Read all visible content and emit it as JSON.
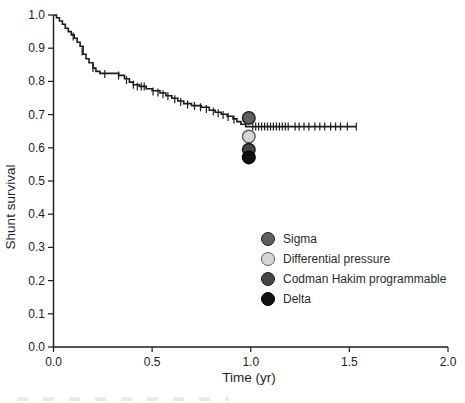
{
  "figure": {
    "background": "#ffffff",
    "text_color": "#1c1c1c"
  },
  "chart_data": {
    "type": "line",
    "chart_kind": "kaplan-meier-step-curve",
    "title": "",
    "xlabel": "Time (yr)",
    "ylabel": "Shunt survival",
    "xlim": [
      0.0,
      2.0
    ],
    "ylim": [
      0.0,
      1.0
    ],
    "grid": false,
    "curve_color": "#1c1c1c",
    "x_ticks": [
      "0.0",
      "0.5",
      "1.0",
      "1.5",
      "2.0"
    ],
    "y_ticks": [
      "0.0",
      "0.1",
      "0.2",
      "0.3",
      "0.4",
      "0.5",
      "0.6",
      "0.7",
      "0.8",
      "0.9",
      "1.0"
    ],
    "series": [
      {
        "name": "Shunt survival (all valve types, overlapping curves)",
        "color": "#1c1c1c",
        "steps": [
          [
            0.0,
            1.0
          ],
          [
            0.015,
            0.992
          ],
          [
            0.03,
            0.982
          ],
          [
            0.045,
            0.972
          ],
          [
            0.06,
            0.96
          ],
          [
            0.075,
            0.95
          ],
          [
            0.09,
            0.94
          ],
          [
            0.105,
            0.93
          ],
          [
            0.12,
            0.918
          ],
          [
            0.135,
            0.906
          ],
          [
            0.15,
            0.882
          ],
          [
            0.165,
            0.868
          ],
          [
            0.18,
            0.856
          ],
          [
            0.2,
            0.84
          ],
          [
            0.215,
            0.83
          ],
          [
            0.235,
            0.824
          ],
          [
            0.33,
            0.818
          ],
          [
            0.36,
            0.808
          ],
          [
            0.385,
            0.798
          ],
          [
            0.405,
            0.79
          ],
          [
            0.435,
            0.785
          ],
          [
            0.47,
            0.778
          ],
          [
            0.5,
            0.772
          ],
          [
            0.54,
            0.765
          ],
          [
            0.57,
            0.757
          ],
          [
            0.6,
            0.749
          ],
          [
            0.63,
            0.741
          ],
          [
            0.66,
            0.733
          ],
          [
            0.7,
            0.727
          ],
          [
            0.75,
            0.722
          ],
          [
            0.79,
            0.713
          ],
          [
            0.82,
            0.707
          ],
          [
            0.85,
            0.701
          ],
          [
            0.88,
            0.695
          ],
          [
            0.91,
            0.687
          ],
          [
            0.93,
            0.679
          ],
          [
            0.95,
            0.671
          ],
          [
            0.975,
            0.664
          ],
          [
            1.535,
            0.664
          ]
        ]
      }
    ],
    "censor_marks": [
      [
        0.1,
        0.935
      ],
      [
        0.145,
        0.89
      ],
      [
        0.2,
        0.84
      ],
      [
        0.26,
        0.822
      ],
      [
        0.33,
        0.818
      ],
      [
        0.37,
        0.804
      ],
      [
        0.405,
        0.79
      ],
      [
        0.425,
        0.785
      ],
      [
        0.445,
        0.785
      ],
      [
        0.46,
        0.785
      ],
      [
        0.505,
        0.77
      ],
      [
        0.53,
        0.767
      ],
      [
        0.555,
        0.761
      ],
      [
        0.58,
        0.755
      ],
      [
        0.615,
        0.746
      ],
      [
        0.645,
        0.738
      ],
      [
        0.68,
        0.73
      ],
      [
        0.715,
        0.726
      ],
      [
        0.745,
        0.722
      ],
      [
        0.775,
        0.717
      ],
      [
        0.81,
        0.709
      ],
      [
        0.835,
        0.704
      ],
      [
        0.86,
        0.699
      ],
      [
        0.885,
        0.693
      ],
      [
        0.915,
        0.685
      ],
      [
        1.01,
        0.664
      ],
      [
        1.025,
        0.664
      ],
      [
        1.04,
        0.664
      ],
      [
        1.055,
        0.664
      ],
      [
        1.07,
        0.664
      ],
      [
        1.085,
        0.664
      ],
      [
        1.1,
        0.664
      ],
      [
        1.115,
        0.664
      ],
      [
        1.13,
        0.664
      ],
      [
        1.145,
        0.664
      ],
      [
        1.16,
        0.664
      ],
      [
        1.175,
        0.664
      ],
      [
        1.19,
        0.664
      ],
      [
        1.225,
        0.664
      ],
      [
        1.245,
        0.664
      ],
      [
        1.27,
        0.664
      ],
      [
        1.295,
        0.664
      ],
      [
        1.325,
        0.664
      ],
      [
        1.35,
        0.664
      ],
      [
        1.375,
        0.664
      ],
      [
        1.405,
        0.664
      ],
      [
        1.43,
        0.664
      ],
      [
        1.455,
        0.664
      ],
      [
        1.49,
        0.664
      ],
      [
        1.535,
        0.664
      ]
    ],
    "endpoint_markers": [
      {
        "label": "Sigma",
        "t": 0.99,
        "survival": 0.69,
        "fill": "#5f5f5f",
        "stroke": "#1d1d1d"
      },
      {
        "label": "Differential pressure",
        "t": 0.99,
        "survival": 0.634,
        "fill": "#d6d6d6",
        "stroke": "#5a5a5a"
      },
      {
        "label": "Codman Hakim programmable",
        "t": 0.99,
        "survival": 0.594,
        "fill": "#464646",
        "stroke": "#1d1d1d"
      },
      {
        "label": "Delta",
        "t": 0.99,
        "survival": 0.571,
        "fill": "#101010",
        "stroke": "#000000"
      }
    ],
    "legend": {
      "position": "lower-right",
      "entries": [
        {
          "label": "Sigma",
          "fill": "#5f5f5f",
          "stroke": "#1d1d1d"
        },
        {
          "label": "Differential pressure",
          "fill": "#d6d6d6",
          "stroke": "#5a5a5a"
        },
        {
          "label": "Codman Hakim programmable",
          "fill": "#464646",
          "stroke": "#1d1d1d"
        },
        {
          "label": "Delta",
          "fill": "#101010",
          "stroke": "#000000"
        }
      ]
    }
  }
}
